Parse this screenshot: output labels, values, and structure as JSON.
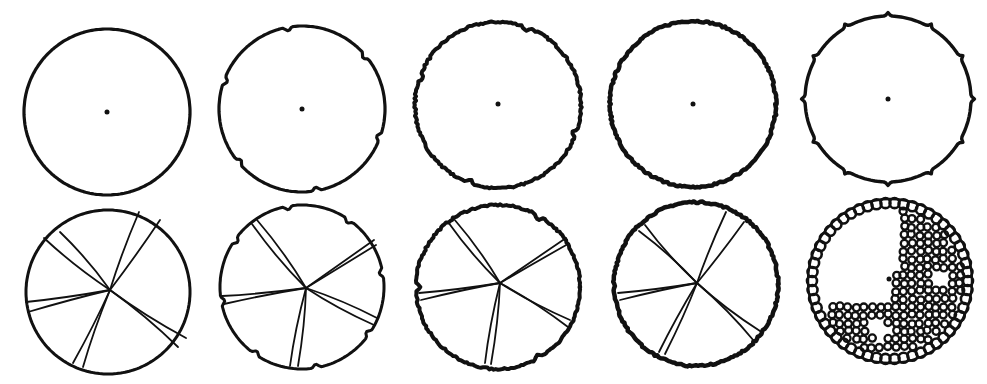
{
  "figure": {
    "width": 987,
    "height": 384,
    "background": "#ffffff",
    "ink": "#111111"
  },
  "rows": [
    {
      "name": "top-row",
      "panels": [
        {
          "id": "t1",
          "cx": 107,
          "cy": 112,
          "r": 83,
          "rim": "smooth",
          "stroke": 3.2,
          "dot": [
            107,
            112
          ],
          "notches": 0,
          "bumps": 0
        },
        {
          "id": "t2",
          "cx": 302,
          "cy": 109,
          "r": 83,
          "rim": "notched",
          "stroke": 3.2,
          "dot": [
            302,
            109
          ],
          "notches": 6,
          "notch_start_deg": -100,
          "bumps": 0
        },
        {
          "id": "t3",
          "cx": 498,
          "cy": 105,
          "r": 83,
          "rim": "rough",
          "stroke": 4.0,
          "dot": [
            498,
            104
          ],
          "notches": 4,
          "notch_start_deg": -70,
          "bumps": 0
        },
        {
          "id": "t4",
          "cx": 693,
          "cy": 104,
          "r": 83,
          "rim": "rough",
          "stroke": 4.5,
          "dot": [
            693,
            104
          ],
          "notches": 0,
          "bumps": 0
        },
        {
          "id": "t5",
          "cx": 888,
          "cy": 99,
          "r": 83,
          "rim": "bumped",
          "stroke": 3.4,
          "dot": [
            888,
            99
          ],
          "notches": 0,
          "bumps": 12
        }
      ]
    },
    {
      "name": "bottom-row",
      "panels": [
        {
          "id": "b1",
          "cx": 108,
          "cy": 292,
          "r": 82,
          "rim": "smooth",
          "stroke": 3.0,
          "center": [
            110,
            290
          ],
          "cracks": true,
          "notches": 0,
          "crack_ends": [
            [
              44,
              238
            ],
            [
              60,
              232
            ],
            [
              139,
              212
            ],
            [
              160,
              220
            ],
            [
              26,
              302
            ],
            [
              28,
              312
            ],
            [
              83,
              367
            ],
            [
              73,
              363
            ],
            [
              186,
              338
            ],
            [
              178,
              347
            ]
          ]
        },
        {
          "id": "b2",
          "cx": 302,
          "cy": 287,
          "r": 82,
          "rim": "notched",
          "stroke": 3.0,
          "center": [
            306,
            288
          ],
          "cracks": true,
          "notches": 8,
          "notch_start_deg": -100,
          "crack_ends": [
            [
              252,
              224
            ],
            [
              257,
              220
            ],
            [
              374,
              240
            ],
            [
              376,
              245
            ],
            [
              222,
              296
            ],
            [
              224,
              304
            ],
            [
              290,
              366
            ],
            [
              298,
              366
            ],
            [
              374,
              325
            ],
            [
              377,
              318
            ]
          ]
        },
        {
          "id": "b3",
          "cx": 498,
          "cy": 287,
          "r": 82,
          "rim": "rough",
          "stroke": 4.0,
          "center": [
            500,
            283
          ],
          "cracks": true,
          "notches": 3,
          "notch_start_deg": -60,
          "crack_ends": [
            [
              448,
              222
            ],
            [
              454,
              219
            ],
            [
              566,
              238
            ],
            [
              568,
              244
            ],
            [
              419,
              293
            ],
            [
              421,
              300
            ],
            [
              485,
              363
            ],
            [
              491,
              364
            ],
            [
              570,
              320
            ],
            [
              568,
              327
            ]
          ]
        },
        {
          "id": "b4",
          "cx": 696,
          "cy": 284,
          "r": 82,
          "rim": "rough",
          "stroke": 4.5,
          "center": [
            697,
            283
          ],
          "cracks": true,
          "notches": 0,
          "crack_ends": [
            [
              645,
              225
            ],
            [
              639,
              231
            ],
            [
              726,
              212
            ],
            [
              744,
              222
            ],
            [
              618,
              293
            ],
            [
              620,
              300
            ],
            [
              659,
              352
            ],
            [
              665,
              354
            ],
            [
              760,
              331
            ],
            [
              754,
              341
            ]
          ]
        },
        {
          "id": "b5",
          "cx": 890,
          "cy": 281,
          "r": 82,
          "rim": "scalloped",
          "stroke": 3.4,
          "dot": [
            889,
            279
          ],
          "cells": true,
          "empty_regions": [
            [
              860,
              245,
              50
            ],
            [
              940,
              278,
              15
            ],
            [
              878,
              330,
              14
            ]
          ]
        }
      ]
    }
  ]
}
